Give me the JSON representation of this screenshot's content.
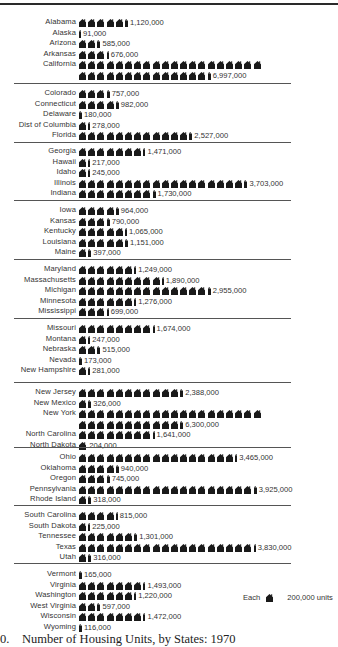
{
  "chart_data": {
    "type": "bar",
    "subtype": "pictograph",
    "title": "Number of Housing Units, by States: 1970",
    "unit_label": "units",
    "icon": "house-icon",
    "icon_value": 200000,
    "legend": {
      "prefix": "Each",
      "value_label": "200,000 units"
    },
    "groups": [
      {
        "states": [
          {
            "name": "Alabama",
            "value": 1120000,
            "label": "1,120,000"
          },
          {
            "name": "Alaska",
            "value": 91000,
            "label": "91,000"
          },
          {
            "name": "Arizona",
            "value": 585000,
            "label": "585,000"
          },
          {
            "name": "Arkansas",
            "value": 676000,
            "label": "676,000"
          },
          {
            "name": "California",
            "value": 6997000,
            "label": "6,997,000",
            "wrap": 20
          }
        ]
      },
      {
        "states": [
          {
            "name": "Colorado",
            "value": 757000,
            "label": "757,000"
          },
          {
            "name": "Connecticut",
            "value": 982000,
            "label": "982,000"
          },
          {
            "name": "Delaware",
            "value": 180000,
            "label": "180,000"
          },
          {
            "name": "Dist of Columbia",
            "value": 278000,
            "label": "278,000"
          },
          {
            "name": "Florida",
            "value": 2527000,
            "label": "2,527,000"
          }
        ]
      },
      {
        "states": [
          {
            "name": "Georgia",
            "value": 1471000,
            "label": "1,471,000"
          },
          {
            "name": "Hawaii",
            "value": 217000,
            "label": "217,000"
          },
          {
            "name": "Idaho",
            "value": 245000,
            "label": "245,000"
          },
          {
            "name": "Illinois",
            "value": 3703000,
            "label": "3,703,000"
          },
          {
            "name": "Indiana",
            "value": 1730000,
            "label": "1,730,000"
          }
        ]
      },
      {
        "states": [
          {
            "name": "Iowa",
            "value": 964000,
            "label": "964,000"
          },
          {
            "name": "Kansas",
            "value": 790000,
            "label": "790,000"
          },
          {
            "name": "Kentucky",
            "value": 1065000,
            "label": "1,065,000"
          },
          {
            "name": "Louisiana",
            "value": 1151000,
            "label": "1,151,000"
          },
          {
            "name": "Maine",
            "value": 397000,
            "label": "397,000"
          }
        ]
      },
      {
        "states": [
          {
            "name": "Maryland",
            "value": 1249000,
            "label": "1,249,000"
          },
          {
            "name": "Massachusetts",
            "value": 1890000,
            "label": "1,890,000"
          },
          {
            "name": "Michigan",
            "value": 2955000,
            "label": "2,955,000"
          },
          {
            "name": "Minnesota",
            "value": 1276000,
            "label": "1,276,000"
          },
          {
            "name": "Mississippi",
            "value": 699000,
            "label": "699,000"
          }
        ]
      },
      {
        "states": [
          {
            "name": "Missouri",
            "value": 1674000,
            "label": "1,674,000"
          },
          {
            "name": "Montana",
            "value": 247000,
            "label": "247,000"
          },
          {
            "name": "Nebraska",
            "value": 515000,
            "label": "515,000"
          },
          {
            "name": "Nevada",
            "value": 173000,
            "label": "173,000"
          },
          {
            "name": "New Hampshire",
            "value": 281000,
            "label": "281,000"
          }
        ]
      },
      {
        "states": [
          {
            "name": "New Jersey",
            "value": 2388000,
            "label": "2,388,000"
          },
          {
            "name": "New Mexico",
            "value": 326000,
            "label": "326,000"
          },
          {
            "name": "New York",
            "value": 6300000,
            "label": "6,300,000",
            "wrap": 20
          },
          {
            "name": "North Carolina",
            "value": 1641000,
            "label": "1,641,000"
          },
          {
            "name": "North Dakota",
            "value": 204000,
            "label": "204,000"
          }
        ]
      },
      {
        "states": [
          {
            "name": "Ohio",
            "value": 3465000,
            "label": "3,465,000"
          },
          {
            "name": "Oklahoma",
            "value": 940000,
            "label": "940,000"
          },
          {
            "name": "Oregon",
            "value": 745000,
            "label": "745,000"
          },
          {
            "name": "Pennsylvania",
            "value": 3925000,
            "label": "3,925,000"
          },
          {
            "name": "Rhode Island",
            "value": 318000,
            "label": "318,000"
          }
        ]
      },
      {
        "states": [
          {
            "name": "South Carolina",
            "value": 815000,
            "label": "815,000"
          },
          {
            "name": "South Dakota",
            "value": 225000,
            "label": "225,000"
          },
          {
            "name": "Tennessee",
            "value": 1301000,
            "label": "1,301,000"
          },
          {
            "name": "Texas",
            "value": 3830000,
            "label": "3,830,000"
          },
          {
            "name": "Utah",
            "value": 316000,
            "label": "316,000"
          }
        ]
      },
      {
        "states": [
          {
            "name": "Vermont",
            "value": 165000,
            "label": "165,000"
          },
          {
            "name": "Virginia",
            "value": 1493000,
            "label": "1,493,000"
          },
          {
            "name": "Washington",
            "value": 1220000,
            "label": "1,220,000"
          },
          {
            "name": "West Virginia",
            "value": 597000,
            "label": "597,000"
          },
          {
            "name": "Wisconsin",
            "value": 1472000,
            "label": "1,472,000"
          },
          {
            "name": "Wyoming",
            "value": 116000,
            "label": "116,000"
          }
        ]
      }
    ]
  },
  "legend": {
    "prefix": "Each",
    "value_label": "200,000 units"
  },
  "caption": {
    "number": "0.",
    "text": "Number of Housing Units, by States: 1970"
  },
  "colors": {
    "ink": "#1a1a1a",
    "rule": "#555555",
    "background": "#ffffff"
  }
}
